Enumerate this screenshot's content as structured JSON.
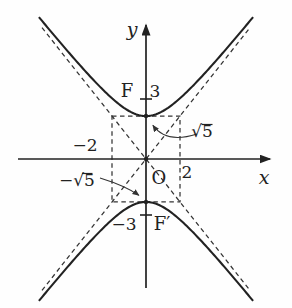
{
  "figure": {
    "background_color": "#fefefe",
    "stroke_color": "#222222",
    "labels": {
      "y_axis": "y",
      "x_axis": "x",
      "origin": "O",
      "focus_top_name": "F",
      "focus_top_value": "3",
      "focus_bottom_name": "F′",
      "focus_bottom_value": "−3",
      "x_positive": "2",
      "x_negative": "−2",
      "vertex_top_value": "√5",
      "vertex_bottom_value": "−√5"
    },
    "math": {
      "vertex_ordinate": "±√5",
      "focus_ordinate": "±3",
      "rectangle_abscissa": "±2"
    },
    "geometry": {
      "origin_px": {
        "x": 146,
        "y": 159
      },
      "scale_px_per_unit": {
        "x": 17,
        "y": 19.2
      },
      "a_sqrt5": 2.2360679775,
      "b": 2,
      "curve_x_extent": 6.3,
      "asymptote_half_dx_px": 104,
      "focus_tick_y_top_px": 99,
      "focus_tick_y_bottom_px": 215,
      "tick_half_len_px": 6,
      "dot_radius_px": 2.2
    }
  }
}
